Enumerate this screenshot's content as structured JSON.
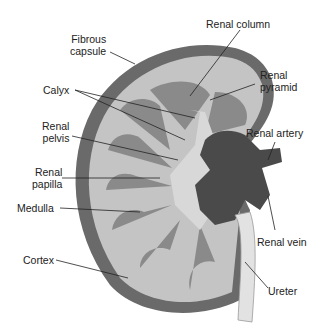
{
  "diagram": {
    "labels": {
      "fibrous_capsule": [
        "Fibrous",
        "capsule"
      ],
      "calyx": "Calyx",
      "renal_pelvis": [
        "Renal",
        "pelvis"
      ],
      "renal_papilla": [
        "Renal",
        "papilla"
      ],
      "medulla": "Medulla",
      "cortex": "Cortex",
      "renal_column": "Renal column",
      "renal_pyramid": [
        "Renal",
        "pyramid"
      ],
      "renal_artery": "Renal artery",
      "renal_vein": "Renal vein",
      "ureter": "Ureter"
    },
    "colors": {
      "capsule": "#6a6a6a",
      "cortex": "#c4c4c4",
      "pyramid": "#8a8a8a",
      "pelvis": "#d8d8d8",
      "vessels": "#4a4a4a",
      "ureter": "#e2e2e2"
    }
  }
}
